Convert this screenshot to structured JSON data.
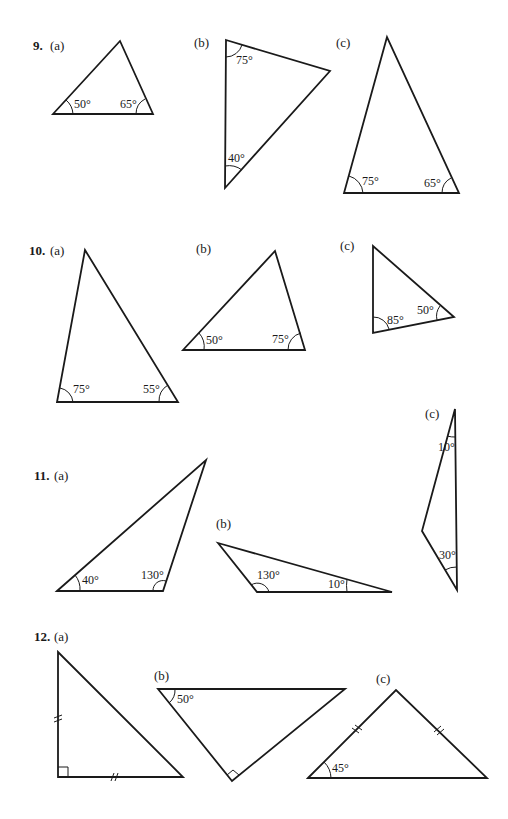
{
  "problems": [
    {
      "number": "9.",
      "parts": [
        {
          "label": "(a)",
          "angles": [
            "50°",
            "65°"
          ]
        },
        {
          "label": "(b)",
          "angles": [
            "75°",
            "40°"
          ]
        },
        {
          "label": "(c)",
          "angles": [
            "75°",
            "65°"
          ]
        }
      ]
    },
    {
      "number": "10.",
      "parts": [
        {
          "label": "(a)",
          "angles": [
            "75°",
            "55°"
          ]
        },
        {
          "label": "(b)",
          "angles": [
            "50°",
            "75°"
          ]
        },
        {
          "label": "(c)",
          "angles": [
            "85°",
            "50°"
          ]
        }
      ]
    },
    {
      "number": "11.",
      "parts": [
        {
          "label": "(a)",
          "angles": [
            "40°",
            "130°"
          ]
        },
        {
          "label": "(b)",
          "angles": [
            "130°",
            "10°"
          ]
        },
        {
          "label": "(c)",
          "angles": [
            "10°",
            "30°"
          ]
        }
      ]
    },
    {
      "number": "12.",
      "parts": [
        {
          "label": "(a)",
          "angles": [],
          "marks": "right angle, two equal legs"
        },
        {
          "label": "(b)",
          "angles": [
            "50°"
          ],
          "marks": "right angle"
        },
        {
          "label": "(c)",
          "angles": [
            "45°"
          ],
          "marks": "two equal sides"
        }
      ]
    }
  ]
}
